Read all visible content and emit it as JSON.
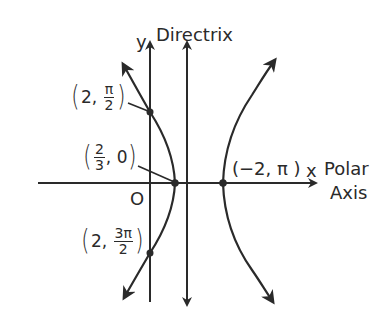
{
  "figure": {
    "colors": {
      "ink": "#2a2a2a",
      "background": "#ffffff"
    },
    "axes": {
      "x_label": "x",
      "polar_axis_line1": "Polar",
      "polar_axis_line2": "Axis",
      "y_label": "y",
      "origin_label": "O",
      "directrix_label": "Directrix"
    },
    "points": {
      "p_top": {
        "open": "(",
        "r": "2,",
        "num": "π",
        "den": "2",
        "close": ")"
      },
      "p_vertex": {
        "open": "(",
        "num": "2",
        "den": "3",
        "theta": ", 0",
        "close": ")"
      },
      "p_right": {
        "text": "(−2, π )"
      },
      "p_bottom": {
        "open": "(",
        "r": "2,",
        "num": "3π",
        "den": "2",
        "close": ")"
      }
    },
    "curve": "hyperbola with focus at pole, vertices (2/3, 0) and (−2, π), directrix vertical line"
  }
}
